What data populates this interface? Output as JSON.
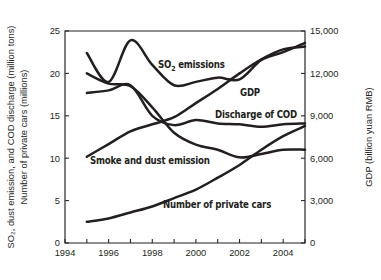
{
  "chart_data": {
    "type": "line",
    "title": "",
    "xlabel": "",
    "ylabel": "SO2, dust emission, and COD discharge (million tons) / Number of private cars (millions)",
    "y2label": "GDP (billion yuan RMB)",
    "grid": false,
    "legend_position": "inline-annotations",
    "xlim": [
      1994,
      2005
    ],
    "ylim": [
      0,
      25
    ],
    "y2lim": [
      0,
      15000
    ],
    "x_ticks": [
      1994,
      1995,
      1996,
      1997,
      1998,
      1999,
      2000,
      2001,
      2002,
      2003,
      2004,
      2005
    ],
    "x_tick_labels": [
      "1994",
      "",
      "1996",
      "",
      "1998",
      "",
      "2000",
      "",
      "2002",
      "",
      "2004",
      ""
    ],
    "y_ticks": [
      0,
      5,
      10,
      15,
      20,
      25
    ],
    "y_tick_labels": [
      "0",
      "5",
      "10",
      "15",
      "20",
      "25"
    ],
    "y2_ticks": [
      0,
      3000,
      6000,
      9000,
      12000,
      15000
    ],
    "y2_tick_labels": [
      "0",
      "3,000",
      "6,000",
      "9,000",
      "12,000",
      "15,000"
    ],
    "x": [
      1995,
      1996,
      1997,
      1998,
      1999,
      2000,
      2001,
      2002,
      2003,
      2004,
      2005
    ],
    "series": [
      {
        "name": "SO2 emissions",
        "label": "SO₂ emissions",
        "axis": "left",
        "units": "million tons",
        "values": [
          22.4,
          19.0,
          23.9,
          21.0,
          18.6,
          19.0,
          19.5,
          19.3,
          21.6,
          22.5,
          23.6
        ]
      },
      {
        "name": "Smoke and dust emission",
        "label": "Smoke and dust emission",
        "axis": "left",
        "units": "million tons",
        "values": [
          20.0,
          18.8,
          18.5,
          16.0,
          13.0,
          11.6,
          11.0,
          10.1,
          10.5,
          11.0,
          11.0
        ]
      },
      {
        "name": "Discharge of COD",
        "label": "Discharge of COD",
        "axis": "left",
        "units": "million tons",
        "values": [
          17.7,
          18.0,
          18.6,
          15.0,
          13.9,
          14.5,
          14.1,
          14.0,
          13.7,
          14.0,
          14.1
        ]
      },
      {
        "name": "Number of private cars",
        "label": "Number of private cars",
        "axis": "left",
        "units": "millions",
        "values": [
          2.5,
          2.9,
          3.6,
          4.3,
          5.3,
          6.3,
          7.7,
          9.2,
          11.0,
          12.6,
          13.8
        ]
      },
      {
        "name": "GDP",
        "label": "GDP",
        "axis": "right",
        "units": "billion yuan RMB",
        "values": [
          6100,
          7000,
          7900,
          8400,
          8900,
          9900,
          10900,
          12000,
          13000,
          13700,
          13900
        ]
      }
    ]
  },
  "axes": {
    "left_title_line1": "SO₂, dust emission, and COD discharge (million tons)",
    "left_title_line2": "Number of private cars (millions)",
    "right_title": "GDP (billion yuan RMB)"
  },
  "annotations": {
    "so2": "SO₂ emissions",
    "gdp": "GDP",
    "cod": "Discharge of COD",
    "smoke": "Smoke and dust emission",
    "cars": "Number of private cars"
  },
  "colors": {
    "ink": "#231f20",
    "background": "#ffffff"
  }
}
